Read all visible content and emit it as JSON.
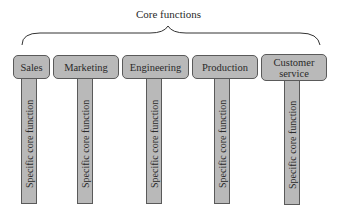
{
  "diagram": {
    "title": "Core functions",
    "functions": [
      {
        "label": "Sales",
        "sub": "Specific core function"
      },
      {
        "label": "Marketing",
        "sub": "Specific core function"
      },
      {
        "label": "Engineering",
        "sub": "Specific core function"
      },
      {
        "label": "Production",
        "sub": "Specific core function"
      },
      {
        "label": "Customer service",
        "sub": "Specific core function"
      }
    ]
  }
}
